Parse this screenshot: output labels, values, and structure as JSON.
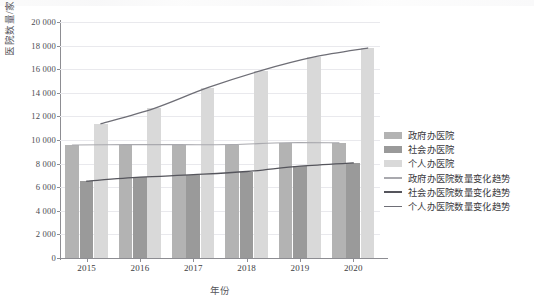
{
  "chart_data": {
    "type": "bar",
    "title": "",
    "subtitle": "",
    "xlabel": "年份",
    "ylabel": "医院数量/家",
    "categories": [
      "2015",
      "2016",
      "2017",
      "2018",
      "2019",
      "2020"
    ],
    "ylim": [
      0,
      20000
    ],
    "ytick_labels": [
      "0",
      "2 000",
      "4 000",
      "6 000",
      "8 000",
      "10 000",
      "12 000",
      "14 000",
      "16 000",
      "18 000",
      "20 000"
    ],
    "ytick_values": [
      0,
      2000,
      4000,
      6000,
      8000,
      10000,
      12000,
      14000,
      16000,
      18000,
      20000
    ],
    "grid": true,
    "legend_position": "right",
    "series": [
      {
        "name": "政府办医院",
        "kind": "bar",
        "color": "#b3b3b3",
        "values": [
          9576,
          9604,
          9605,
          9613,
          9771,
          9755
        ]
      },
      {
        "name": "社会办医院",
        "kind": "bar",
        "color": "#9a9a9a",
        "values": [
          6514,
          6846,
          7058,
          7330,
          7792,
          8053
        ]
      },
      {
        "name": "个人办医院",
        "kind": "bar",
        "color": "#d9d9d9",
        "values": [
          11379,
          12678,
          14430,
          15881,
          17038,
          17795
        ]
      },
      {
        "name": "政府办医院数量变化趋势",
        "kind": "line",
        "color": "#a9a9ae",
        "values": [
          9576,
          9604,
          9605,
          9613,
          9771,
          9755
        ]
      },
      {
        "name": "社会办医院数量变化趋势",
        "kind": "line",
        "color": "#55555c",
        "values": [
          6514,
          6846,
          7058,
          7330,
          7792,
          8053
        ]
      },
      {
        "name": "个人办医院数量变化趋势",
        "kind": "line",
        "color": "#6e6e76",
        "values": [
          11379,
          12678,
          14430,
          15881,
          17038,
          17795
        ]
      }
    ]
  },
  "legend": {
    "items": [
      {
        "label": "政府办医院",
        "type": "swatch",
        "class": "s0"
      },
      {
        "label": "社会办医院",
        "type": "swatch",
        "class": "s1"
      },
      {
        "label": "个人办医院",
        "type": "swatch",
        "class": "s2"
      },
      {
        "label": "政府办医院数量变化趋势",
        "type": "line",
        "class": "l0"
      },
      {
        "label": "社会办医院数量变化趋势",
        "type": "line",
        "class": "l1"
      },
      {
        "label": "个人办医院数量变化趋势",
        "type": "line",
        "class": "l2"
      }
    ]
  },
  "axes": {
    "y_title": "医院数量/家",
    "x_title": "年份"
  }
}
